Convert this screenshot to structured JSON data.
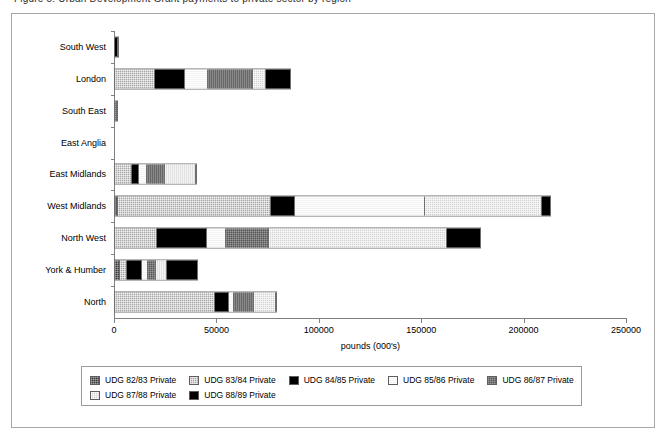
{
  "top_cropped_text": "Figure 5: Urban Development Grant payments to private sector by region",
  "axis": {
    "x_title": "pounds (000's)",
    "x_ticks": [
      "0",
      "50000",
      "100000",
      "150000",
      "200000",
      "250000"
    ],
    "x_min": 0,
    "x_max": 250000
  },
  "legend": {
    "items": [
      {
        "label": "UDG 82/83 Private",
        "swatch": "dark-dotted-gray"
      },
      {
        "label": "UDG 83/84 Private",
        "swatch": "mid-gray-checker"
      },
      {
        "label": "UDG 84/85 Private",
        "swatch": "solid-black"
      },
      {
        "label": "UDG 85/86 Private",
        "swatch": "near-white"
      },
      {
        "label": "UDG 86/87 Private",
        "swatch": "dark-gray-checker"
      },
      {
        "label": "UDG 87/88 Private",
        "swatch": "light-gray-checker"
      },
      {
        "label": "UDG 88/89 Private",
        "swatch": "solid-black"
      }
    ]
  },
  "chart_data": {
    "type": "bar",
    "orientation": "horizontal",
    "stacked": true,
    "title": "",
    "xlabel": "pounds (000's)",
    "ylabel": "",
    "xlim": [
      0,
      250000
    ],
    "grid": false,
    "legend_position": "bottom",
    "categories": [
      "South West",
      "London",
      "South East",
      "East Anglia",
      "East Midlands",
      "West Midlands",
      "North West",
      "York & Humber",
      "North"
    ],
    "series": [
      {
        "name": "UDG 82/83 Private",
        "values": [
          0,
          0,
          900,
          0,
          0,
          1500,
          0,
          2400,
          0
        ]
      },
      {
        "name": "UDG 83/84 Private",
        "values": [
          0,
          19500,
          0,
          0,
          8300,
          74500,
          20500,
          3400,
          48800
        ]
      },
      {
        "name": "UDG 84/85 Private",
        "values": [
          1500,
          14600,
          0,
          0,
          3400,
          11700,
          24400,
          7300,
          6800
        ]
      },
      {
        "name": "UDG 85/86 Private",
        "values": [
          0,
          11200,
          0,
          0,
          3900,
          63500,
          9300,
          2900,
          2400
        ]
      },
      {
        "name": "UDG 86/87 Private",
        "values": [
          0,
          22000,
          0,
          0,
          8800,
          0,
          21000,
          3900,
          9800
        ]
      },
      {
        "name": "UDG 87/88 Private",
        "values": [
          0,
          6300,
          0,
          0,
          15200,
          57100,
          86800,
          5400,
          10700
        ]
      },
      {
        "name": "UDG 88/89 Private",
        "values": [
          0,
          11700,
          0,
          0,
          0,
          4200,
          16100,
          14600,
          0
        ]
      }
    ],
    "totals": [
      1500,
      85300,
      900,
      0,
      39600,
      212500,
      178100,
      39900,
      78500
    ]
  }
}
